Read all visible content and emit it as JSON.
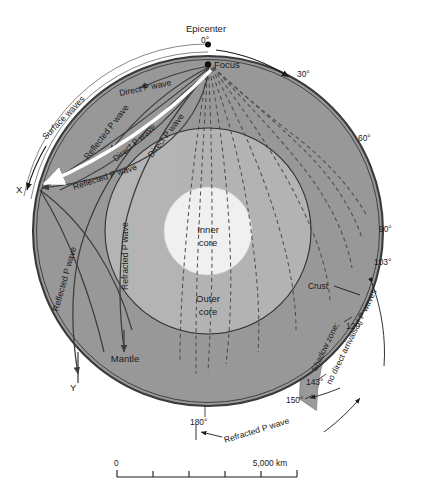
{
  "figure": {
    "colors": {
      "mantle": "#989898",
      "outer_core": "#b4b4b4",
      "inner_core": "#f0f0f0",
      "crust": "#3a3a3a",
      "shadow_zone": "#9a9a9a",
      "background": "#ffffff",
      "ray_solid": "#3c3c3c",
      "ray_dashed": "#4a4a4a",
      "surface_wave": "#ffffff",
      "text": "#1a1a1a"
    }
  },
  "layers": {
    "mantle_label": "Mantle",
    "outer_core_label_line1": "Outer",
    "outer_core_label_line2": "core",
    "inner_core_label_line1": "Inner",
    "inner_core_label_line2": "core",
    "crust_label": "Crust"
  },
  "points": {
    "epicenter_label": "Epicenter",
    "focus_label": "Focus",
    "station_x": "X",
    "station_y": "Y"
  },
  "angles": [
    {
      "id": "a0",
      "text": "0°"
    },
    {
      "id": "a30",
      "text": "30°"
    },
    {
      "id": "a60",
      "text": "60°"
    },
    {
      "id": "a90",
      "text": "90°"
    },
    {
      "id": "a103",
      "text": "103°"
    },
    {
      "id": "a120",
      "text": "120°"
    },
    {
      "id": "a143",
      "text": "143°"
    },
    {
      "id": "a150",
      "text": "150°"
    },
    {
      "id": "a180",
      "text": "180°"
    }
  ],
  "waves": {
    "surface_waves": "Surface waves",
    "direct_p_1": "Direct P wave",
    "direct_p_2": "Direct P wave",
    "direct_p_3": "Direct P wave",
    "reflected_p_1": "Reflected P wave",
    "reflected_p_2": "Reflected P wave",
    "reflected_p_3": "Reflected P wave",
    "refracted_p_vertical": "Refracted P wave",
    "refracted_p_bottom": "Refracted P wave"
  },
  "shadow_zone": {
    "line1": "Shadow zone;",
    "line2": "no direct arrivals of P waves"
  },
  "scale_bar": {
    "start_label": "0",
    "end_label": "5,000 km",
    "ticks": 6
  }
}
